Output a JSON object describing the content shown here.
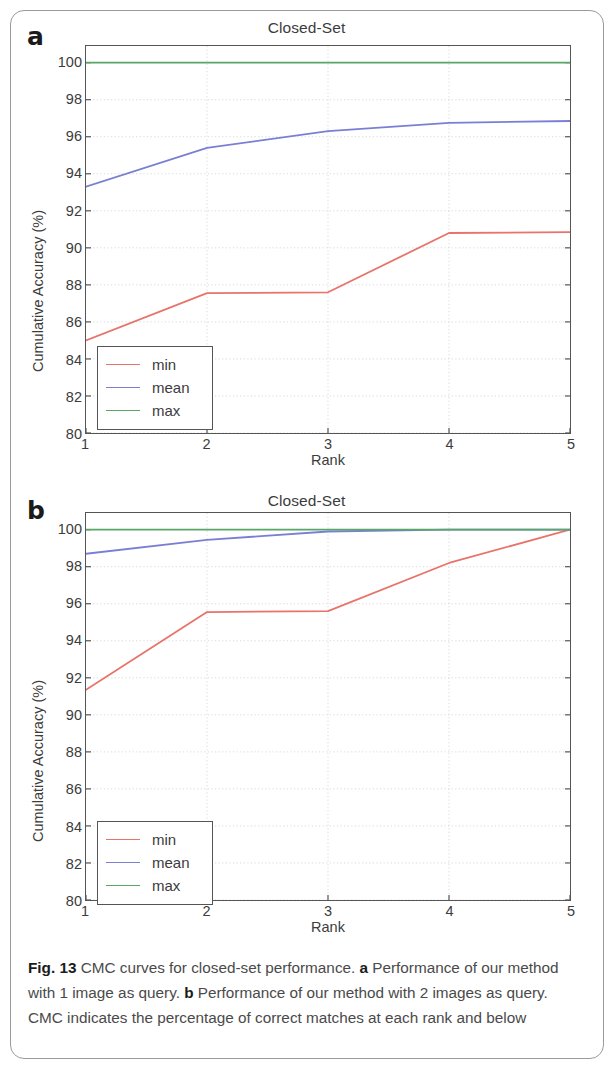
{
  "figure": {
    "caption_prefix": "Fig. 13",
    "caption_part_1": " CMC curves for closed-set performance. ",
    "caption_bold_a": "a",
    "caption_part_2": " Performance of our method with 1 image as query. ",
    "caption_bold_b": "b",
    "caption_part_3": " Performance of our method with 2 images as query. CMC indicates the percentage of correct matches at each rank and below"
  },
  "colors": {
    "min": "#e8736a",
    "mean": "#7b7fd4",
    "max": "#5aa668",
    "axis": "#555555",
    "grid": "#cfcfcf",
    "text": "#3c3c3c"
  },
  "panels": [
    {
      "letter": "a",
      "title": "Closed-Set",
      "xlabel": "Rank",
      "ylabel": "Cumulative Accuracy (%)",
      "xticks": [
        "1",
        "2",
        "3",
        "4",
        "5"
      ],
      "yticks": [
        "100",
        "98",
        "96",
        "94",
        "92",
        "90",
        "88",
        "86",
        "84",
        "82",
        "80"
      ],
      "legend": [
        {
          "label": "min",
          "color": "#e8736a"
        },
        {
          "label": "mean",
          "color": "#7b7fd4"
        },
        {
          "label": "max",
          "color": "#5aa668"
        }
      ]
    },
    {
      "letter": "b",
      "title": "Closed-Set",
      "xlabel": "Rank",
      "ylabel": "Cumulative Accuracy (%)",
      "xticks": [
        "1",
        "2",
        "3",
        "4",
        "5"
      ],
      "yticks": [
        "100",
        "98",
        "96",
        "94",
        "92",
        "90",
        "88",
        "86",
        "84",
        "82",
        "80"
      ],
      "legend": [
        {
          "label": "min",
          "color": "#e8736a"
        },
        {
          "label": "mean",
          "color": "#7b7fd4"
        },
        {
          "label": "max",
          "color": "#5aa668"
        }
      ]
    }
  ],
  "chart_data": [
    {
      "type": "line",
      "panel": "a",
      "title": "Closed-Set",
      "xlabel": "Rank",
      "ylabel": "Cumulative Accuracy (%)",
      "x": [
        1,
        2,
        3,
        4,
        5
      ],
      "xlim": [
        1,
        5
      ],
      "ylim": [
        80,
        100.9
      ],
      "xticks": [
        1,
        2,
        3,
        4,
        5
      ],
      "yticks": [
        80,
        82,
        84,
        86,
        88,
        90,
        92,
        94,
        96,
        98,
        100
      ],
      "grid": true,
      "legend_position": "lower left",
      "series": [
        {
          "name": "min",
          "color": "#e8736a",
          "values": [
            85.0,
            87.55,
            87.6,
            90.8,
            90.85
          ]
        },
        {
          "name": "mean",
          "color": "#7b7fd4",
          "values": [
            93.3,
            95.4,
            96.3,
            96.75,
            96.85
          ]
        },
        {
          "name": "max",
          "color": "#5aa668",
          "values": [
            100.0,
            100.0,
            100.0,
            100.0,
            100.0
          ]
        }
      ]
    },
    {
      "type": "line",
      "panel": "b",
      "title": "Closed-Set",
      "xlabel": "Rank",
      "ylabel": "Cumulative Accuracy (%)",
      "x": [
        1,
        2,
        3,
        4,
        5
      ],
      "xlim": [
        1,
        5
      ],
      "ylim": [
        80,
        100.9
      ],
      "xticks": [
        1,
        2,
        3,
        4,
        5
      ],
      "yticks": [
        80,
        82,
        84,
        86,
        88,
        90,
        92,
        94,
        96,
        98,
        100
      ],
      "grid": true,
      "legend_position": "lower left",
      "series": [
        {
          "name": "min",
          "color": "#e8736a",
          "values": [
            91.35,
            95.55,
            95.6,
            98.2,
            100.0
          ]
        },
        {
          "name": "mean",
          "color": "#7b7fd4",
          "values": [
            98.7,
            99.45,
            99.9,
            100.0,
            100.0
          ]
        },
        {
          "name": "max",
          "color": "#5aa668",
          "values": [
            100.0,
            100.0,
            100.0,
            100.0,
            100.0
          ]
        }
      ]
    }
  ]
}
